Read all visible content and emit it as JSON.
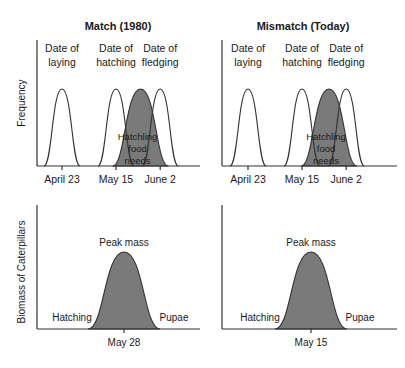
{
  "chart_data": [
    {
      "id": "match-frequency",
      "type": "area",
      "title": "Match (1980)",
      "ylabel": "Frequency",
      "xlabel": "",
      "x_ticks": [
        "April 23",
        "May 15",
        "June 2"
      ],
      "x_tick_days": [
        0,
        22,
        40
      ],
      "x_range_days": [
        -10,
        50
      ],
      "series": [
        {
          "name": "Date of laying",
          "label_lines": [
            "Date of",
            "laying"
          ],
          "peak_day": 0,
          "shaded": false,
          "peak": 1.0
        },
        {
          "name": "Date of hatching",
          "label_lines": [
            "Date of",
            "hatching"
          ],
          "peak_day": 22,
          "shaded": false,
          "peak": 1.0
        },
        {
          "name": "Hatchling food needs",
          "label_lines": [
            "Hatchling",
            "food",
            "needs"
          ],
          "peak_day": 32,
          "shaded": true,
          "peak": 1.0
        },
        {
          "name": "Date of fledging",
          "label_lines": [
            "Date of",
            "fledging"
          ],
          "peak_day": 40,
          "shaded": false,
          "peak": 1.0
        }
      ]
    },
    {
      "id": "mismatch-frequency",
      "type": "area",
      "title": "Mismatch (Today)",
      "ylabel": "",
      "xlabel": "",
      "x_ticks": [
        "April 23",
        "May 15",
        "June 2"
      ],
      "x_tick_days": [
        0,
        22,
        40
      ],
      "x_range_days": [
        -10,
        50
      ],
      "series": [
        {
          "name": "Date of laying",
          "label_lines": [
            "Date of",
            "laying"
          ],
          "peak_day": 0,
          "shaded": false,
          "peak": 1.0
        },
        {
          "name": "Date of hatching",
          "label_lines": [
            "Date of",
            "hatching"
          ],
          "peak_day": 22,
          "shaded": false,
          "peak": 1.0
        },
        {
          "name": "Hatchling food needs",
          "label_lines": [
            "Hatchling",
            "food",
            "needs"
          ],
          "peak_day": 33,
          "shaded": true,
          "peak": 1.0
        },
        {
          "name": "Date of fledging",
          "label_lines": [
            "Date of",
            "fledging"
          ],
          "peak_day": 40,
          "shaded": false,
          "peak": 1.0
        }
      ]
    },
    {
      "id": "match-biomass",
      "type": "area",
      "title": "",
      "ylabel": "Biomass of Caterpillars",
      "xlabel": "",
      "x_ticks": [
        "May 28"
      ],
      "peak_label": "Peak mass",
      "left_label": "Hatching",
      "right_label": "Pupae",
      "series": [
        {
          "name": "Caterpillar biomass",
          "peak_label": "May 28",
          "shaded": true,
          "peak": 1.0
        }
      ]
    },
    {
      "id": "mismatch-biomass",
      "type": "area",
      "title": "",
      "ylabel": "",
      "xlabel": "",
      "x_ticks": [
        "May 15"
      ],
      "peak_label": "Peak mass",
      "left_label": "Hatching",
      "right_label": "Pupae",
      "series": [
        {
          "name": "Caterpillar biomass",
          "peak_label": "May 15",
          "shaded": true,
          "peak": 1.0
        }
      ]
    }
  ],
  "colors": {
    "shaded": "#7a7a7a",
    "stroke": "#333333",
    "text": "#1a1a1a"
  }
}
